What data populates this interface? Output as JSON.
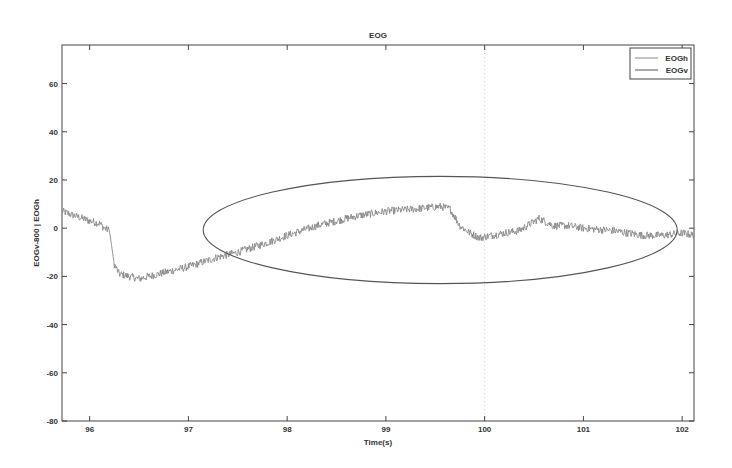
{
  "chart_data": {
    "type": "line",
    "title": "EOG",
    "xlabel": "Time(s)",
    "ylabel": "EOGv-800 | EOGh",
    "xlim": [
      95.72,
      102.12
    ],
    "ylim": [
      -80,
      76
    ],
    "xticks": [
      96,
      97,
      98,
      99,
      100,
      101,
      102
    ],
    "yticks": [
      60,
      40,
      20,
      0,
      -20,
      -40,
      -60,
      -80
    ],
    "grid": false,
    "legend_position": "upper right",
    "legend": [
      "EOGh",
      "EOGv"
    ],
    "colors": {
      "EOGh": "#888888",
      "EOGv": "#555555",
      "frame": "#444444",
      "ellipse": "#555555"
    },
    "series": [
      {
        "name": "EOGh",
        "x": [
          95.72,
          96.0,
          96.1,
          96.15,
          96.2,
          96.25,
          96.3,
          96.5,
          96.7,
          97.0,
          97.3,
          97.5,
          97.8,
          98.0,
          98.3,
          98.5,
          98.7,
          99.0,
          99.3,
          99.55,
          99.65,
          99.75,
          99.85,
          99.95,
          100.2,
          100.35,
          100.55,
          100.7,
          100.85,
          101.0,
          101.3,
          101.6,
          101.8,
          102.0,
          102.12
        ],
        "values": [
          7,
          3,
          2,
          0,
          -1,
          -15,
          -19,
          -21,
          -19,
          -16,
          -12,
          -10,
          -6,
          -3,
          1,
          3,
          5,
          7,
          8,
          9,
          8,
          1,
          -2,
          -4,
          -2,
          -1,
          4,
          1,
          1,
          0,
          -1,
          -3,
          -3,
          -2,
          -3
        ]
      },
      {
        "name": "EOGv",
        "x": [],
        "values": []
      }
    ],
    "annotations": [
      {
        "type": "ellipse",
        "center": [
          99.55,
          0
        ],
        "x_radius_s": 2.4,
        "y_extent": [
          -23,
          21.5
        ]
      },
      {
        "type": "dotted-vertical-line",
        "x": 100
      }
    ]
  }
}
